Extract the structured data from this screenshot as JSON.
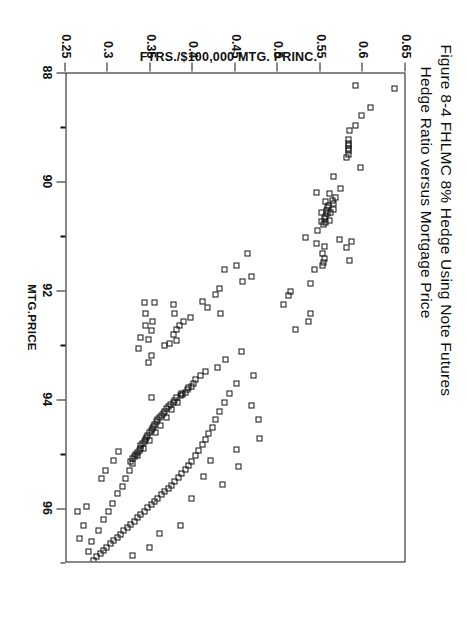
{
  "figure": {
    "title_line_1": "Figure 8-4  FHLMC 8% Hedge Using Note Futures",
    "title_line_2": "Hedge Ratio versus Mortgage Price"
  },
  "chart_data": {
    "type": "scatter",
    "xlabel": "MTG.PRICE",
    "ylabel": "FTRS./$100,000 MTG. PRINC.",
    "xlim": [
      88,
      97
    ],
    "ylim": [
      0.25,
      0.65
    ],
    "x_ticks_major": [
      88,
      90,
      92,
      94,
      96
    ],
    "x_ticks_minor": [
      89,
      91,
      93,
      95,
      97
    ],
    "y_ticks_major": [
      0.65,
      0.6,
      0.55,
      0.5,
      0.45,
      0.4,
      0.35,
      0.3,
      0.25
    ],
    "x_tick_labels": [
      "88",
      "90",
      "92",
      "94",
      "96"
    ],
    "y_tick_labels": [
      "0.65",
      "0.6",
      "0.55",
      "0.5",
      "0.45",
      "0.4",
      "0.35",
      "0.3",
      "0.25"
    ],
    "y_axis_inverted": true,
    "grid": false,
    "legend": null,
    "marker": "open-square",
    "marker_color": "#121212",
    "rotation_deg": 90,
    "n_points": 201,
    "points": [
      [
        88.28,
        0.638
      ],
      [
        88.22,
        0.592
      ],
      [
        88.62,
        0.61
      ],
      [
        88.78,
        0.6
      ],
      [
        88.95,
        0.592
      ],
      [
        89.05,
        0.585
      ],
      [
        89.22,
        0.584
      ],
      [
        89.28,
        0.584
      ],
      [
        89.32,
        0.584
      ],
      [
        89.37,
        0.584
      ],
      [
        89.42,
        0.584
      ],
      [
        89.48,
        0.584
      ],
      [
        89.55,
        0.582
      ],
      [
        89.72,
        0.598
      ],
      [
        89.9,
        0.566
      ],
      [
        90.12,
        0.575
      ],
      [
        90.2,
        0.562
      ],
      [
        90.28,
        0.569
      ],
      [
        90.33,
        0.565
      ],
      [
        90.38,
        0.566
      ],
      [
        90.42,
        0.561
      ],
      [
        90.46,
        0.56
      ],
      [
        90.5,
        0.566
      ],
      [
        90.52,
        0.558
      ],
      [
        90.56,
        0.563
      ],
      [
        90.58,
        0.559
      ],
      [
        90.62,
        0.557
      ],
      [
        90.66,
        0.556
      ],
      [
        90.7,
        0.562
      ],
      [
        90.74,
        0.557
      ],
      [
        90.78,
        0.555
      ],
      [
        90.36,
        0.557
      ],
      [
        90.55,
        0.552
      ],
      [
        90.72,
        0.552
      ],
      [
        90.18,
        0.547
      ],
      [
        90.88,
        0.548
      ],
      [
        91.05,
        0.573
      ],
      [
        91.12,
        0.547
      ],
      [
        91.18,
        0.556
      ],
      [
        91.3,
        0.554
      ],
      [
        91.4,
        0.556
      ],
      [
        91.48,
        0.555
      ],
      [
        91.52,
        0.553
      ],
      [
        91.2,
        0.582
      ],
      [
        91.08,
        0.588
      ],
      [
        91.44,
        0.585
      ],
      [
        91.6,
        0.544
      ],
      [
        91.02,
        0.534
      ],
      [
        91.85,
        0.54
      ],
      [
        92.0,
        0.516
      ],
      [
        92.08,
        0.513
      ],
      [
        92.25,
        0.508
      ],
      [
        92.4,
        0.54
      ],
      [
        92.55,
        0.537
      ],
      [
        92.7,
        0.522
      ],
      [
        91.3,
        0.465
      ],
      [
        91.52,
        0.452
      ],
      [
        91.6,
        0.438
      ],
      [
        91.72,
        0.47
      ],
      [
        91.82,
        0.46
      ],
      [
        91.95,
        0.432
      ],
      [
        92.05,
        0.428
      ],
      [
        92.18,
        0.412
      ],
      [
        92.3,
        0.418
      ],
      [
        92.4,
        0.433
      ],
      [
        92.48,
        0.398
      ],
      [
        92.55,
        0.39
      ],
      [
        92.62,
        0.385
      ],
      [
        92.7,
        0.382
      ],
      [
        92.8,
        0.378
      ],
      [
        92.9,
        0.382
      ],
      [
        92.95,
        0.374
      ],
      [
        93.0,
        0.368
      ],
      [
        92.25,
        0.378
      ],
      [
        92.4,
        0.38
      ],
      [
        92.2,
        0.356
      ],
      [
        92.55,
        0.354
      ],
      [
        92.72,
        0.352
      ],
      [
        92.88,
        0.349
      ],
      [
        92.62,
        0.345
      ],
      [
        92.4,
        0.345
      ],
      [
        92.85,
        0.34
      ],
      [
        92.2,
        0.344
      ],
      [
        93.05,
        0.337
      ],
      [
        93.18,
        0.352
      ],
      [
        93.3,
        0.349
      ],
      [
        93.25,
        0.44
      ],
      [
        93.1,
        0.458
      ],
      [
        93.4,
        0.43
      ],
      [
        93.48,
        0.416
      ],
      [
        93.55,
        0.41
      ],
      [
        93.62,
        0.404
      ],
      [
        93.7,
        0.402
      ],
      [
        93.75,
        0.399
      ],
      [
        93.8,
        0.395
      ],
      [
        93.85,
        0.392
      ],
      [
        93.88,
        0.388
      ],
      [
        93.92,
        0.386
      ],
      [
        93.96,
        0.382
      ],
      [
        94.0,
        0.38
      ],
      [
        94.04,
        0.378
      ],
      [
        94.08,
        0.375
      ],
      [
        94.12,
        0.372
      ],
      [
        94.16,
        0.37
      ],
      [
        94.2,
        0.368
      ],
      [
        94.24,
        0.366
      ],
      [
        94.28,
        0.364
      ],
      [
        94.32,
        0.362
      ],
      [
        94.36,
        0.36
      ],
      [
        94.4,
        0.358
      ],
      [
        94.44,
        0.356
      ],
      [
        94.48,
        0.355
      ],
      [
        94.52,
        0.353
      ],
      [
        94.56,
        0.352
      ],
      [
        94.6,
        0.35
      ],
      [
        94.64,
        0.348
      ],
      [
        94.68,
        0.347
      ],
      [
        94.72,
        0.345
      ],
      [
        94.76,
        0.344
      ],
      [
        94.8,
        0.342
      ],
      [
        94.84,
        0.34
      ],
      [
        94.88,
        0.339
      ],
      [
        94.92,
        0.338
      ],
      [
        94.96,
        0.336
      ],
      [
        95.0,
        0.334
      ],
      [
        95.04,
        0.332
      ],
      [
        95.08,
        0.33
      ],
      [
        95.12,
        0.328
      ],
      [
        93.55,
        0.472
      ],
      [
        93.7,
        0.452
      ],
      [
        93.88,
        0.444
      ],
      [
        94.05,
        0.438
      ],
      [
        94.2,
        0.432
      ],
      [
        94.35,
        0.428
      ],
      [
        94.5,
        0.424
      ],
      [
        94.62,
        0.42
      ],
      [
        94.72,
        0.416
      ],
      [
        94.82,
        0.412
      ],
      [
        94.92,
        0.408
      ],
      [
        95.02,
        0.404
      ],
      [
        95.12,
        0.4
      ],
      [
        95.2,
        0.396
      ],
      [
        95.28,
        0.392
      ],
      [
        95.35,
        0.388
      ],
      [
        95.42,
        0.384
      ],
      [
        95.5,
        0.38
      ],
      [
        95.56,
        0.376
      ],
      [
        95.62,
        0.372
      ],
      [
        95.68,
        0.368
      ],
      [
        95.74,
        0.364
      ],
      [
        95.8,
        0.36
      ],
      [
        95.86,
        0.356
      ],
      [
        95.92,
        0.352
      ],
      [
        95.98,
        0.348
      ],
      [
        96.04,
        0.344
      ],
      [
        96.1,
        0.34
      ],
      [
        96.16,
        0.336
      ],
      [
        96.22,
        0.332
      ],
      [
        96.28,
        0.328
      ],
      [
        96.34,
        0.324
      ],
      [
        96.4,
        0.32
      ],
      [
        96.46,
        0.316
      ],
      [
        96.52,
        0.312
      ],
      [
        96.58,
        0.308
      ],
      [
        96.64,
        0.304
      ],
      [
        96.7,
        0.3
      ],
      [
        96.76,
        0.296
      ],
      [
        96.82,
        0.292
      ],
      [
        96.88,
        0.288
      ],
      [
        96.94,
        0.284
      ],
      [
        96.6,
        0.282
      ],
      [
        96.78,
        0.278
      ],
      [
        96.4,
        0.29
      ],
      [
        96.2,
        0.296
      ],
      [
        96.05,
        0.302
      ],
      [
        95.9,
        0.306
      ],
      [
        95.72,
        0.312
      ],
      [
        95.58,
        0.318
      ],
      [
        95.44,
        0.322
      ],
      [
        95.3,
        0.326
      ],
      [
        95.16,
        0.33
      ],
      [
        95.02,
        0.336
      ],
      [
        94.88,
        0.343
      ],
      [
        94.74,
        0.35
      ],
      [
        94.6,
        0.357
      ],
      [
        94.46,
        0.363
      ],
      [
        94.32,
        0.37
      ],
      [
        94.18,
        0.376
      ],
      [
        94.04,
        0.383
      ],
      [
        93.9,
        0.389
      ],
      [
        93.76,
        0.396
      ],
      [
        95.3,
        0.298
      ],
      [
        95.44,
        0.294
      ],
      [
        96.3,
        0.272
      ],
      [
        96.54,
        0.268
      ],
      [
        95.95,
        0.276
      ],
      [
        96.05,
        0.265
      ],
      [
        95.1,
        0.308
      ],
      [
        94.95,
        0.314
      ],
      [
        96.85,
        0.33
      ],
      [
        96.7,
        0.35
      ],
      [
        96.45,
        0.362
      ],
      [
        96.3,
        0.386
      ],
      [
        95.8,
        0.4
      ],
      [
        95.4,
        0.414
      ],
      [
        95.1,
        0.422
      ],
      [
        94.9,
        0.452
      ],
      [
        95.22,
        0.455
      ],
      [
        94.1,
        0.47
      ],
      [
        94.35,
        0.478
      ],
      [
        94.7,
        0.48
      ],
      [
        95.55,
        0.436
      ],
      [
        93.95,
        0.352
      ]
    ]
  }
}
